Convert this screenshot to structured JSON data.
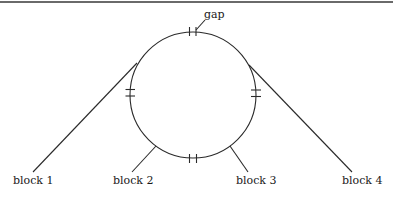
{
  "diagram": {
    "type": "ring-with-blocks",
    "colors": {
      "stroke": "#2a2a2a",
      "text": "#1a1a1a",
      "rule": "#6a6a6a",
      "background": "#ffffff"
    },
    "ring": {
      "cx": 193,
      "cy": 95,
      "r": 63
    },
    "gap_label": "gap",
    "blocks": [
      {
        "label": "block 1"
      },
      {
        "label": "block 2"
      },
      {
        "label": "block 3"
      },
      {
        "label": "block 4"
      }
    ]
  }
}
